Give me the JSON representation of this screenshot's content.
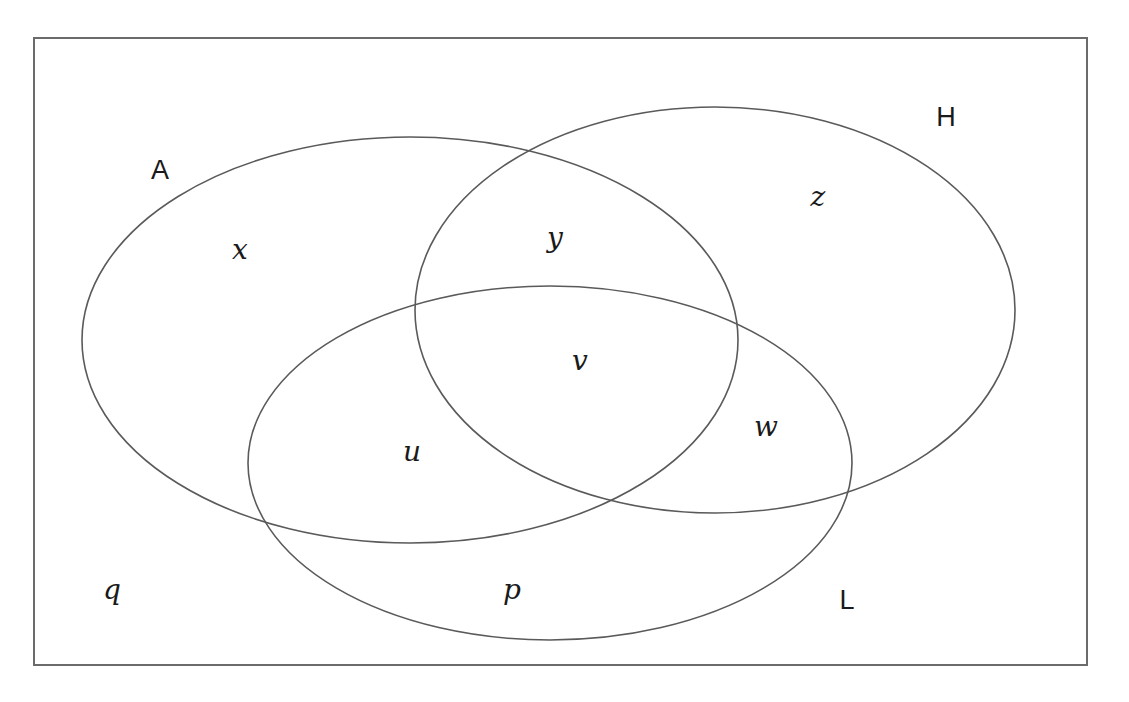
{
  "diagram": {
    "type": "venn-3-set",
    "background_color": "#ffffff",
    "stroke_color": "#5a5a5a",
    "text_color": "#1a1a1a",
    "universe": {
      "name": "universe-rectangle",
      "x": 34,
      "y": 38,
      "width": 1053,
      "height": 627,
      "stroke_width": 2
    },
    "sets": [
      {
        "id": "A",
        "label": "A",
        "label_x": 160,
        "label_y": 170,
        "cx": 410,
        "cy": 340,
        "rx": 328,
        "ry": 203
      },
      {
        "id": "H",
        "label": "H",
        "label_x": 946,
        "label_y": 117,
        "cx": 715,
        "cy": 310,
        "rx": 300,
        "ry": 203
      },
      {
        "id": "L",
        "label": "L",
        "label_x": 847,
        "label_y": 600,
        "cx": 550,
        "cy": 463,
        "rx": 302,
        "ry": 177
      }
    ],
    "regions": [
      {
        "id": "x",
        "label": "x",
        "label_x": 240,
        "label_y": 250,
        "membership": "A only"
      },
      {
        "id": "y",
        "label": "y",
        "label_x": 555,
        "label_y": 238,
        "membership": "A and H"
      },
      {
        "id": "z",
        "label": "z",
        "label_x": 818,
        "label_y": 197,
        "membership": "H only"
      },
      {
        "id": "v",
        "label": "v",
        "label_x": 580,
        "label_y": 361,
        "membership": "A and H and L"
      },
      {
        "id": "u",
        "label": "u",
        "label_x": 412,
        "label_y": 452,
        "membership": "A and L"
      },
      {
        "id": "w",
        "label": "w",
        "label_x": 766,
        "label_y": 427,
        "membership": "H and L"
      },
      {
        "id": "p",
        "label": "p",
        "label_x": 512,
        "label_y": 590,
        "membership": "L only"
      },
      {
        "id": "q",
        "label": "q",
        "label_x": 112,
        "label_y": 590,
        "membership": "outside all sets"
      }
    ]
  }
}
